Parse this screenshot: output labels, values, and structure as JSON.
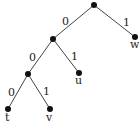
{
  "diagram": {
    "type": "binary-tree",
    "colors": {
      "node": "#111111",
      "edge": "#444444",
      "text": "#222222"
    },
    "nodes": [
      {
        "id": "root",
        "x": 94,
        "y": 5,
        "label": ""
      },
      {
        "id": "n0",
        "x": 53,
        "y": 39,
        "label": ""
      },
      {
        "id": "w",
        "x": 135,
        "y": 37,
        "label": "w"
      },
      {
        "id": "n00",
        "x": 28,
        "y": 74,
        "label": ""
      },
      {
        "id": "u",
        "x": 79,
        "y": 73,
        "label": "u"
      },
      {
        "id": "t",
        "x": 8,
        "y": 109,
        "label": "t"
      },
      {
        "id": "v",
        "x": 50,
        "y": 109,
        "label": "v"
      }
    ],
    "edges": [
      {
        "from": "root",
        "to": "n0",
        "label": "0"
      },
      {
        "from": "root",
        "to": "w",
        "label": "1"
      },
      {
        "from": "n0",
        "to": "n00",
        "label": "0"
      },
      {
        "from": "n0",
        "to": "u",
        "label": "1"
      },
      {
        "from": "n00",
        "to": "t",
        "label": "0"
      },
      {
        "from": "n00",
        "to": "v",
        "label": "1"
      }
    ]
  }
}
